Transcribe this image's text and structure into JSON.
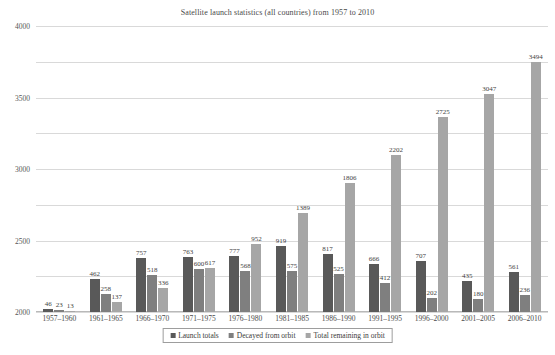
{
  "chart_data": {
    "type": "bar",
    "title": "Satellite launch statistics (all countries) from 1957 to 2010",
    "xlabel": "",
    "ylabel": "",
    "ylim": [
      0,
      4000
    ],
    "yticks": [
      0,
      500,
      1000,
      1500,
      2000,
      2500,
      3000,
      3500,
      4000
    ],
    "grid": true,
    "legend_position": "bottom",
    "categories": [
      "1957–1960",
      "1961–1965",
      "1966–1970",
      "1971–1975",
      "1976–1980",
      "1981–1985",
      "1986–1990",
      "1991–1995",
      "1996–2000",
      "2001–2005",
      "2006–2010"
    ],
    "series": [
      {
        "name": "Launch totals",
        "color": "#595959",
        "values": [
          46,
          462,
          757,
          763,
          777,
          919,
          817,
          666,
          707,
          435,
          561
        ]
      },
      {
        "name": "Decayed from orbit",
        "color": "#7f7f7f",
        "values": [
          23,
          258,
          518,
          600,
          568,
          575,
          525,
          412,
          202,
          180,
          236
        ]
      },
      {
        "name": "Total remaining in orbit",
        "color": "#a6a6a6",
        "values": [
          13,
          137,
          336,
          617,
          952,
          1389,
          1806,
          2202,
          2725,
          3047,
          3494
        ]
      }
    ]
  },
  "legend": {
    "items": [
      {
        "label": "Launch totals"
      },
      {
        "label": "Decayed from orbit"
      },
      {
        "label": "Total remaining in orbit"
      }
    ]
  }
}
